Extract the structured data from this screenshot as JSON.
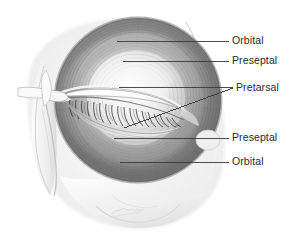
{
  "figure": {
    "style": "grayscale medical illustration",
    "background_color": "#ffffff",
    "ink_color": "#2b2b2b",
    "leader_line_color": "#3a3a3a",
    "artist_signature": "signature (illegible)"
  },
  "labels": [
    {
      "id": "orbital-superior",
      "text": "Orbital",
      "text_x": 232,
      "text_y": 35,
      "leader": {
        "x1": 117,
        "y1": 41,
        "x2": 229,
        "y2": 41
      }
    },
    {
      "id": "preseptal-superior",
      "text": "Preseptal",
      "text_x": 232,
      "text_y": 55,
      "leader": {
        "x1": 123,
        "y1": 61,
        "x2": 229,
        "y2": 61
      }
    },
    {
      "id": "pretarsal",
      "text": "Pretarsal",
      "text_x": 236,
      "text_y": 82,
      "leader": {
        "x1": 119,
        "y1": 87,
        "x2": 233,
        "y2": 88
      },
      "leader2": {
        "x1": 124,
        "y1": 128,
        "x2": 233,
        "y2": 88
      }
    },
    {
      "id": "preseptal-inferior",
      "text": "Preseptal",
      "text_x": 232,
      "text_y": 132,
      "leader": {
        "x1": 114,
        "y1": 138,
        "x2": 229,
        "y2": 138
      }
    },
    {
      "id": "orbital-inferior",
      "text": "Orbital",
      "text_x": 232,
      "text_y": 156,
      "leader": {
        "x1": 120,
        "y1": 162,
        "x2": 229,
        "y2": 162
      }
    }
  ],
  "anatomy_regions": [
    {
      "name": "orbital-part-superior",
      "description": "outer ring of orbicularis oculi above the eye"
    },
    {
      "name": "preseptal-part-superior",
      "description": "middle band of upper eyelid muscle over the orbital septum"
    },
    {
      "name": "pretarsal-part-upper",
      "description": "narrow band of upper eyelid muscle over the tarsal plate"
    },
    {
      "name": "pretarsal-part-lower",
      "description": "narrow band of lower eyelid muscle over the tarsal plate"
    },
    {
      "name": "preseptal-part-inferior",
      "description": "middle band of lower eyelid muscle"
    },
    {
      "name": "orbital-part-inferior",
      "description": "outer ring of orbicularis oculi below the eye"
    },
    {
      "name": "eyelashes",
      "description": "lash row along closed lid margin"
    },
    {
      "name": "medial-canthal-tendon",
      "description": "tendon at medial canthus"
    },
    {
      "name": "lacrimal-sac",
      "description": "lacrimal sac and nasolacrimal duct region"
    },
    {
      "name": "nasal-bridge",
      "description": "nose profile at left margin"
    },
    {
      "name": "zygomatic-prominence",
      "description": "cheekbone below orbit"
    },
    {
      "name": "temporal-margin",
      "description": "temple edge at right of orbit"
    }
  ]
}
